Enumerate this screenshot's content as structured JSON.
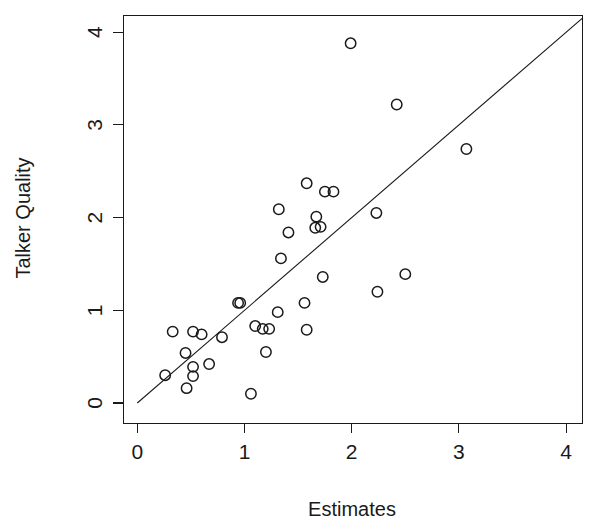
{
  "chart_data": {
    "type": "scatter",
    "title": "",
    "xlabel": "Estimates",
    "ylabel": "Talker Quality",
    "xlim": [
      -0.13,
      4.15
    ],
    "ylim": [
      -0.22,
      4.18
    ],
    "xticks": [
      0,
      1,
      2,
      3,
      4
    ],
    "yticks": [
      0,
      1,
      2,
      3,
      4
    ],
    "xtick_labels": [
      "0",
      "1",
      "2",
      "3",
      "4"
    ],
    "ytick_labels": [
      "0",
      "1",
      "2",
      "3",
      "4"
    ],
    "grid": false,
    "legend": null,
    "marker": "open-circle",
    "marker_color": "#1a1a1a",
    "reference_line": {
      "type": "identity",
      "slope": 1,
      "intercept": 0,
      "from": [
        0,
        0
      ],
      "to": [
        4.15,
        4.15
      ],
      "color": "#1a1a1a"
    },
    "points": [
      {
        "x": 0.26,
        "y": 0.3
      },
      {
        "x": 0.33,
        "y": 0.77
      },
      {
        "x": 0.45,
        "y": 0.54
      },
      {
        "x": 0.46,
        "y": 0.16
      },
      {
        "x": 0.52,
        "y": 0.77
      },
      {
        "x": 0.52,
        "y": 0.39
      },
      {
        "x": 0.52,
        "y": 0.29
      },
      {
        "x": 0.6,
        "y": 0.74
      },
      {
        "x": 0.67,
        "y": 0.42
      },
      {
        "x": 0.79,
        "y": 0.71
      },
      {
        "x": 0.94,
        "y": 1.08
      },
      {
        "x": 0.96,
        "y": 1.08
      },
      {
        "x": 1.06,
        "y": 0.1
      },
      {
        "x": 1.1,
        "y": 0.83
      },
      {
        "x": 1.17,
        "y": 0.8
      },
      {
        "x": 1.2,
        "y": 0.55
      },
      {
        "x": 1.23,
        "y": 0.8
      },
      {
        "x": 1.31,
        "y": 0.98
      },
      {
        "x": 1.32,
        "y": 2.09
      },
      {
        "x": 1.34,
        "y": 1.56
      },
      {
        "x": 1.41,
        "y": 1.84
      },
      {
        "x": 1.56,
        "y": 1.08
      },
      {
        "x": 1.58,
        "y": 2.37
      },
      {
        "x": 1.58,
        "y": 0.79
      },
      {
        "x": 1.66,
        "y": 1.89
      },
      {
        "x": 1.67,
        "y": 2.01
      },
      {
        "x": 1.71,
        "y": 1.9
      },
      {
        "x": 1.73,
        "y": 1.36
      },
      {
        "x": 1.75,
        "y": 2.28
      },
      {
        "x": 1.83,
        "y": 2.28
      },
      {
        "x": 1.99,
        "y": 3.88
      },
      {
        "x": 2.23,
        "y": 2.05
      },
      {
        "x": 2.24,
        "y": 1.2
      },
      {
        "x": 2.42,
        "y": 3.22
      },
      {
        "x": 2.5,
        "y": 1.39
      },
      {
        "x": 3.07,
        "y": 2.74
      }
    ]
  }
}
